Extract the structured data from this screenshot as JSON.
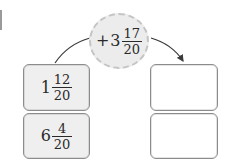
{
  "operation": {
    "sign": "+",
    "whole": "3",
    "numerator": "17",
    "denominator": "20"
  },
  "inputs": [
    {
      "whole": "1",
      "numerator": "12",
      "denominator": "20"
    },
    {
      "whole": "6",
      "numerator": "4",
      "denominator": "20"
    }
  ],
  "outputs": [
    {
      "value": ""
    },
    {
      "value": ""
    }
  ],
  "colors": {
    "box_fill": "#efefef",
    "circle_fill": "#ececec",
    "border": "#8c8c8c",
    "arrow": "#3a3a3a"
  }
}
